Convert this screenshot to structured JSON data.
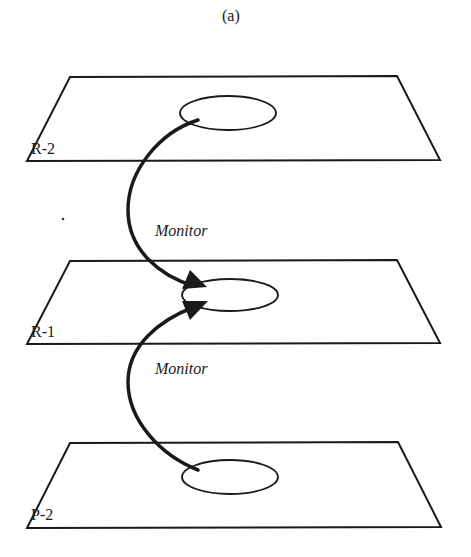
{
  "caption": "(a)",
  "planes": [
    {
      "id": "R-2",
      "label": "R-2"
    },
    {
      "id": "R-1",
      "label": "R-1"
    },
    {
      "id": "P-2",
      "label": "P-2"
    }
  ],
  "arrows": [
    {
      "from": "R-2",
      "to": "R-1",
      "label": "Monitor"
    },
    {
      "from": "P-2",
      "to": "R-1",
      "label": "Monitor"
    }
  ],
  "colors": {
    "line": "#1a1a1a",
    "background": "#ffffff"
  }
}
